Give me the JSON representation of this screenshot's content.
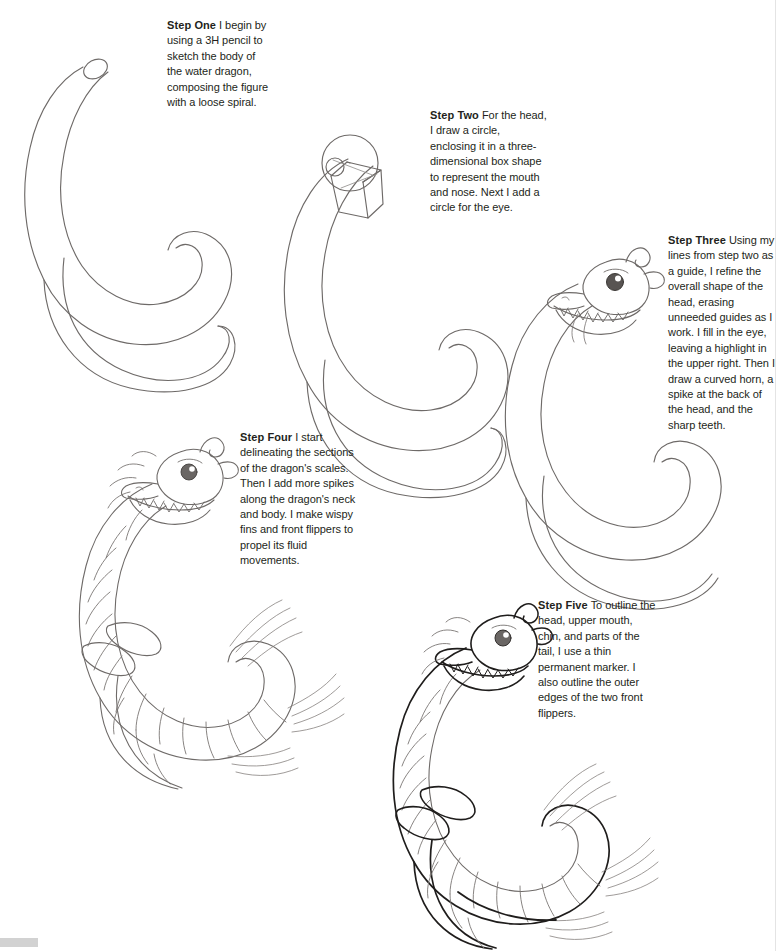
{
  "page": {
    "background_color": "#ffffff",
    "pencil_line_color": "#6e6a68",
    "ink_line_color": "#1a1a1a",
    "text_color": "#231f20",
    "width": 780,
    "height": 951
  },
  "steps": [
    {
      "label": "Step One",
      "body": "I begin by using a 3H pencil to sketch the body of the water dragon, composing the figure with a loose spiral.",
      "figure_name": "step-one-spiral-body-sketch"
    },
    {
      "label": "Step Two",
      "body": "For the head, I draw a circle, enclosing it in a three-dimensional box shape to represent the mouth and nose. Next I add a circle for the eye.",
      "figure_name": "step-two-head-circle-and-box-sketch"
    },
    {
      "label": "Step Three",
      "body": "Using my lines from step two as a guide, I refine the overall shape of the head, erasing unneeded guides as I work. I fill in the eye, leaving a highlight in the upper right. Then I draw a curved horn, a spike at the back of the head, and the sharp teeth.",
      "figure_name": "step-three-refined-head-sketch"
    },
    {
      "label": "Step Four",
      "body": "I start delineating the sections of the dragon's scales. Then I add more spikes along the dragon's neck and body. I make wispy fins and front flippers to propel its fluid movements.",
      "figure_name": "step-four-scales-fins-flippers-sketch"
    },
    {
      "label": "Step Five",
      "body": "To outline the head, upper mouth, chin, and parts of the tail, I use a thin permanent marker. I also outline the outer edges of the two front flippers.",
      "figure_name": "step-five-inked-outline-drawing"
    }
  ],
  "artifacts": {
    "bottom_left_bar_color": "#d2d2d2",
    "right_edge_line_color": "#e4e4e4"
  }
}
